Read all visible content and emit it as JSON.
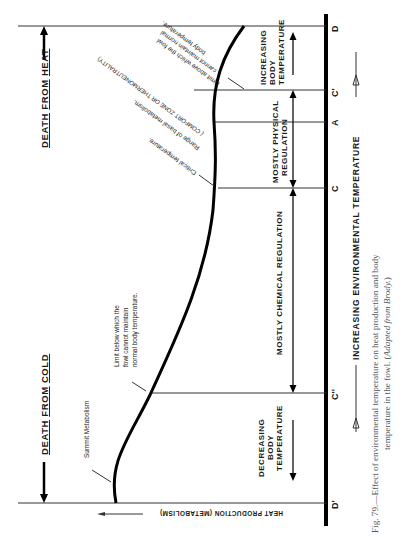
{
  "figure": {
    "orientation": "rotated 90deg counter-clockwise",
    "x_axis_label": "INCREASING ENVIRONMENTAL TEMPERATURE",
    "y_axis_label": "HEAT PRODUCTION (METABOLISM)",
    "death_from_heat": {
      "w1": "DEATH",
      "w2": "FROM",
      "w3": "HEAT"
    },
    "death_from_cold": {
      "w1": "DEATH",
      "w2": "FROM",
      "w3": "COLD"
    },
    "points": [
      "D'",
      "C''",
      "C",
      "A",
      "C'",
      "D"
    ],
    "regions": {
      "decreasing": [
        "DECREASING",
        "BODY",
        "TEMPERATURE"
      ],
      "chemical": "MOSTLY CHEMICAL REGULATION",
      "physical": [
        "MOSTLY PHYSICAL",
        "REGULATION"
      ],
      "increasing": [
        "INCREASING",
        "BODY",
        "TEMPERATURE"
      ]
    },
    "annotations": {
      "summit": "Summit Metabolism",
      "limit_below": [
        "Limit below which the",
        "fowl cannot maintain",
        "normal body temperature."
      ],
      "critical": "Critical temperature.",
      "basal": "Range of basal metabolism.",
      "comfort": "( COMFORT ZONE OR THERMONEUTRALITY)",
      "limit_above": [
        "Limit above which the fowl",
        "cannot maintain normal",
        "body temperature."
      ]
    },
    "caption": {
      "line1": "Fig. 79.—Effect of environmental temperature on heat production and body",
      "line2_plain": "temperature in the fowl.  (",
      "line2_italic": "Adapted from Brody.",
      "line2_end": ")"
    }
  }
}
